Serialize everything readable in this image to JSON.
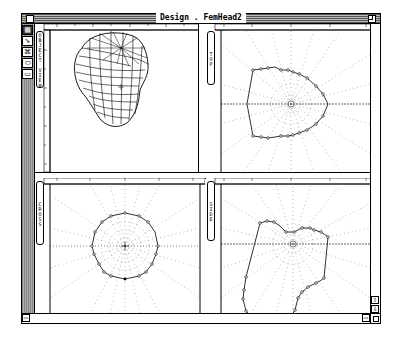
{
  "window": {
    "title": "Design . FemHead2"
  },
  "palette": {
    "tools": [
      {
        "name": "wireframe-tool",
        "glyph": "▦",
        "selected": true
      },
      {
        "name": "arrow-tool",
        "glyph": "➘",
        "selected": false
      },
      {
        "name": "point-tool",
        "glyph": "⌘",
        "selected": false
      },
      {
        "name": "oval-tool",
        "glyph": "⬭",
        "selected": false
      },
      {
        "name": "rect-tool",
        "glyph": "▭",
        "selected": false
      }
    ]
  },
  "panes": [
    {
      "id": "object-view",
      "label": "OBJECT VIEW",
      "top_ruler": [
        "2",
        "1",
        "0",
        "1",
        "2"
      ],
      "left_ruler": [
        "1",
        "0",
        "1"
      ]
    },
    {
      "id": "top-section",
      "label": "TOP SECTION",
      "top_ruler": [
        "2",
        "1",
        "0",
        "1",
        "2"
      ],
      "left_ruler": [
        "1",
        "0",
        "1"
      ]
    },
    {
      "id": "cross-section",
      "label": "CROSS SECTION",
      "top_ruler": [
        "2",
        "1",
        "0",
        "1",
        "2"
      ],
      "left_ruler": [
        "1",
        "0",
        "1"
      ]
    },
    {
      "id": "side-section",
      "label": "SIDE SECTION",
      "top_ruler": [
        "2",
        "1",
        "0",
        "1",
        "2"
      ],
      "left_ruler": [
        "1",
        "0",
        "1"
      ]
    }
  ],
  "scrollbars": {
    "up_arrow": "⇧",
    "down_arrow": "⇩",
    "left_arrow": "⇦",
    "right_arrow": "⇨"
  },
  "colors": {
    "line": "#000000",
    "grid_dots": "#888888",
    "background": "#ffffff"
  }
}
